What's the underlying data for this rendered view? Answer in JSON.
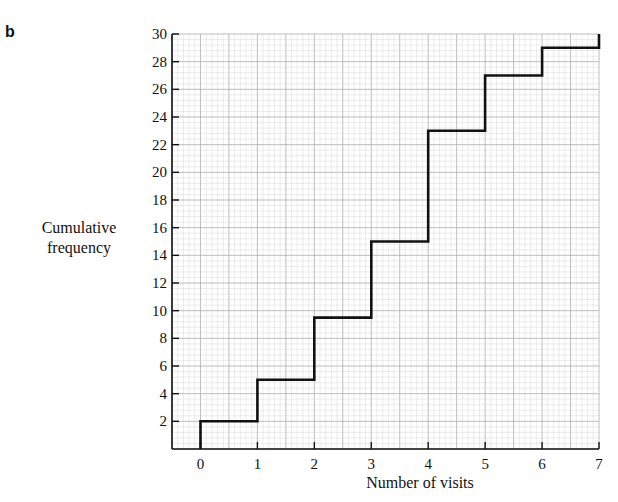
{
  "panel_label": "b",
  "chart_data": {
    "type": "line",
    "subtype": "step",
    "title": "",
    "xlabel": "Number of visits",
    "ylabel": "Cumulative frequency",
    "xlim": [
      -0.5,
      7
    ],
    "ylim": [
      0,
      30
    ],
    "x_ticks": [
      0,
      1,
      2,
      3,
      4,
      5,
      6,
      7
    ],
    "y_ticks": [
      2,
      4,
      6,
      8,
      10,
      12,
      14,
      16,
      18,
      20,
      22,
      24,
      26,
      28,
      30
    ],
    "grid": true,
    "legend": null,
    "x": [
      0,
      1,
      2,
      3,
      4,
      5,
      6,
      7
    ],
    "values": [
      2,
      5,
      9.5,
      15,
      23,
      27,
      29,
      30
    ],
    "step_points": [
      [
        0,
        0
      ],
      [
        0,
        2
      ],
      [
        1,
        2
      ],
      [
        1,
        5
      ],
      [
        2,
        5
      ],
      [
        2,
        9.5
      ],
      [
        3,
        9.5
      ],
      [
        3,
        15
      ],
      [
        4,
        15
      ],
      [
        4,
        23
      ],
      [
        5,
        23
      ],
      [
        5,
        27
      ],
      [
        6,
        27
      ],
      [
        6,
        29
      ],
      [
        7,
        29
      ],
      [
        7,
        30
      ]
    ],
    "colors": {
      "line": "#111111",
      "grid_minor": "#d8d8d8",
      "grid_major": "#b5b5b5",
      "axis": "#111111"
    }
  },
  "axes": {
    "xlabel": "Number of visits",
    "ylabel_line1": "Cumulative",
    "ylabel_line2": "frequency"
  }
}
